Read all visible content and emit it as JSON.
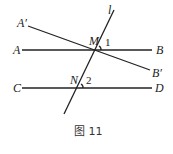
{
  "diagram": {
    "caption": "图 11",
    "points": {
      "A_prime": "A′",
      "A": "A",
      "B": "B",
      "B_prime": "B′",
      "C": "C",
      "D": "D",
      "M": "M",
      "N": "N",
      "l": "l"
    },
    "angles": {
      "angle1": "1",
      "angle2": "2"
    },
    "lines": [
      {
        "name": "AB",
        "from": [
          22,
          50
        ],
        "to": [
          152,
          50
        ]
      },
      {
        "name": "CD",
        "from": [
          22,
          88
        ],
        "to": [
          152,
          88
        ]
      },
      {
        "name": "A'B'",
        "from": [
          28,
          26
        ],
        "to": [
          150,
          70
        ]
      },
      {
        "name": "l",
        "from": [
          114,
          10
        ],
        "to": [
          64,
          114
        ]
      }
    ]
  }
}
